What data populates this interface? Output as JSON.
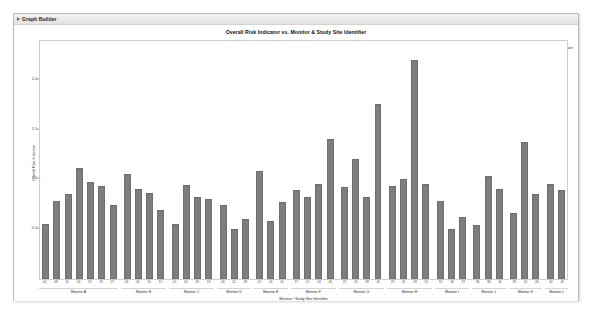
{
  "window": {
    "title": "Graph Builder",
    "disclosure_icon": "disclosure-triangle-icon"
  },
  "chart": {
    "title": "Overall Risk Indicator vs. Monitor & Study Site Identifier",
    "legend": {
      "label": "Overall Risk Indicator",
      "swatch_icon": "legend-swatch-icon",
      "color": "#7e7e7e"
    }
  },
  "chart_data": {
    "type": "bar",
    "title": "Overall Risk Indicator vs. Monitor & Study Site Identifier",
    "xlabel": "Monitor / Study Site Identifier",
    "ylabel": "Overall Risk Indicator",
    "ylim": [
      0,
      2.25
    ],
    "yticks": [
      0.5,
      1.0,
      1.5,
      2.0
    ],
    "ytick_labels": [
      "0.5",
      "1.0",
      "1.5",
      "2.0"
    ],
    "grid": false,
    "legend_position": "top-right",
    "bar_color": "#7e7e7e",
    "series": [
      {
        "name": "Overall Risk Indicator",
        "color": "#7e7e7e"
      }
    ],
    "groups": [
      {
        "label": "Monitor A",
        "categories": [
          "04",
          "08",
          "11",
          "14",
          "19",
          "23",
          "27"
        ],
        "values": [
          0.52,
          0.74,
          0.8,
          1.05,
          0.92,
          0.88,
          0.7
        ]
      },
      {
        "label": "Monitor B",
        "categories": [
          "02",
          "06",
          "10",
          "15"
        ],
        "values": [
          0.99,
          0.85,
          0.81,
          0.65
        ]
      },
      {
        "label": "Monitor C",
        "categories": [
          "01",
          "05",
          "09",
          "13"
        ],
        "values": [
          0.52,
          0.89,
          0.78,
          0.76
        ]
      },
      {
        "label": "Monitor D",
        "categories": [
          "03",
          "12",
          "18"
        ],
        "values": [
          0.7,
          0.47,
          0.57
        ]
      },
      {
        "label": "Monitor E",
        "categories": [
          "07",
          "16",
          "20"
        ],
        "values": [
          1.02,
          0.55,
          0.73
        ]
      },
      {
        "label": "Monitor F",
        "categories": [
          "17",
          "21",
          "24",
          "26"
        ],
        "values": [
          0.84,
          0.78,
          0.9,
          1.32
        ]
      },
      {
        "label": "Monitor G",
        "categories": [
          "22",
          "25",
          "28",
          "30"
        ],
        "values": [
          0.87,
          1.13,
          0.78,
          1.65
        ]
      },
      {
        "label": "Monitor H",
        "categories": [
          "29",
          "31",
          "33",
          "35"
        ],
        "values": [
          0.88,
          0.95,
          2.07,
          0.9
        ]
      },
      {
        "label": "Monitor I",
        "categories": [
          "32",
          "34",
          "37"
        ],
        "values": [
          0.74,
          0.47,
          0.59
        ]
      },
      {
        "label": "Monitor J",
        "categories": [
          "36",
          "38",
          "40"
        ],
        "values": [
          0.51,
          0.97,
          0.85
        ]
      },
      {
        "label": "Monitor K",
        "categories": [
          "39",
          "41",
          "43"
        ],
        "values": [
          0.62,
          1.3,
          0.8
        ]
      },
      {
        "label": "Monitor L",
        "categories": [
          "42",
          "45"
        ],
        "values": [
          0.9,
          0.84
        ]
      }
    ]
  }
}
